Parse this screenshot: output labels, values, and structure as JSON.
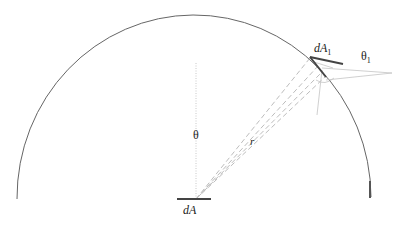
{
  "diagram": {
    "type": "radiometry-hemisphere",
    "labels": {
      "dA": "dA",
      "dA1_main": "dA",
      "dA1_sub": "1",
      "theta": "θ",
      "theta1_main": "θ",
      "theta1_sub": "1",
      "r": "r"
    },
    "colors": {
      "hemisphere": "#555555",
      "surface": "#444444",
      "rays": "#bbbbbb",
      "text": "#222222"
    }
  }
}
